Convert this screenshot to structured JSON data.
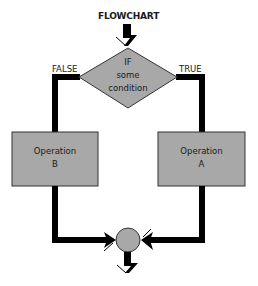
{
  "title": "FLOWCHART",
  "decision": {
    "lines": [
      "IF",
      "some",
      "condition"
    ]
  },
  "branches": {
    "false_label": "FALSE",
    "true_label": "TRUE"
  },
  "operations": {
    "left": {
      "line1": "Operation",
      "line2": "B"
    },
    "right": {
      "line1": "Operation",
      "line2": "A"
    }
  },
  "colors": {
    "shape_fill": "#a8a8a8",
    "stroke": "#000000",
    "background": "#ffffff"
  }
}
